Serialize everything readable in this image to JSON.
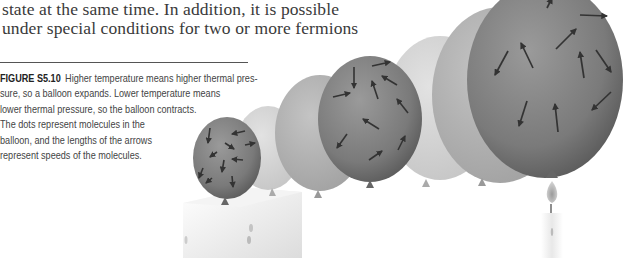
{
  "body_text": {
    "lines": [
      "state at the same time. In addition, it is possible",
      "under special conditions for two or more fermions"
    ]
  },
  "caption": {
    "figure_label": "FIGURE S5.10",
    "lines": [
      "Higher temperature means higher thermal pres-",
      "sure, so a balloon expands. Lower temperature means",
      "lower thermal pressure, so the balloon contracts.",
      "The dots represent molecules in the",
      "balloon, and the lengths of the arrows",
      "represent speeds of the molecules."
    ]
  },
  "illustration": {
    "description": "Sequence of balloons growing from small (over ice block) to large (over lit candle)",
    "left_object": "ice-block",
    "right_object": "candle-flame",
    "balloon_count": 7,
    "colors": {
      "balloon_dark": "#7a7a7a",
      "balloon_light": "#c8c8c8",
      "arrow": "#3a3a3a"
    }
  }
}
